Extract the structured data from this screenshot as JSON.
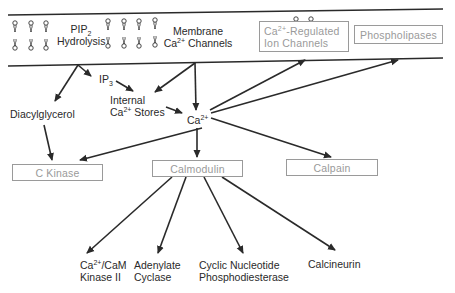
{
  "membrane": {
    "pip2_hydrolysis": {
      "line1_main": "PIP",
      "line1_sub": "2",
      "line2": "Hydrolysis"
    },
    "membrane_channels": {
      "line1": "Membrane",
      "line2_pre": "Ca",
      "line2_sup": "2+",
      "line2_post": " Channels"
    },
    "regulated_channels": {
      "line1_pre": "Ca",
      "line1_sup": "2+",
      "line1_post": "-Regulated",
      "line2": "Ion Channels"
    },
    "phospholipases": "Phospholipases"
  },
  "nodes": {
    "ip3": {
      "main": "IP",
      "sub": "3"
    },
    "internal_stores": {
      "line1": "Internal",
      "line2_pre": "Ca",
      "line2_sup": "2+",
      "line2_post": " Stores"
    },
    "diacylglycerol": "Diacylglycerol",
    "calcium": {
      "main": "Ca",
      "sup": "2+"
    },
    "c_kinase": "C Kinase",
    "calmodulin": "Calmodulin",
    "calpain": "Calpain"
  },
  "targets": {
    "camk2": {
      "line1_pre": "Ca",
      "line1_sup": "2+",
      "line1_post": "/CaM",
      "line2": "Kinase II"
    },
    "adenylate_cyclase": {
      "line1": "Adenylate",
      "line2": "Cyclase"
    },
    "pde": {
      "line1": "Cyclic Nucleotide",
      "line2": "Phosphodiesterase"
    },
    "calcineurin": "Calcineurin"
  },
  "colors": {
    "text": "#2a2a2a",
    "box": "#9a9a9a",
    "line": "#2a2a2a"
  }
}
